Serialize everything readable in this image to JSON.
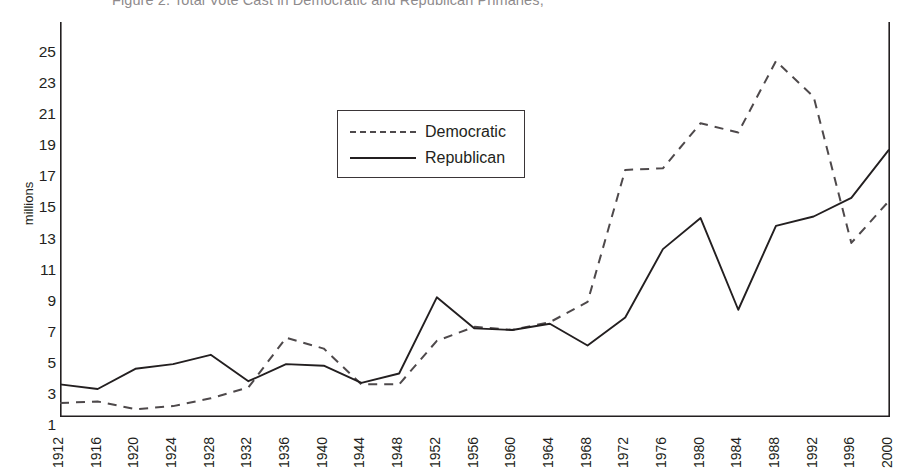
{
  "figure": {
    "title": "Figure 2. Total Vote Cast in Democratic and Republican Primaries,"
  },
  "axes": {
    "ylabel": "millions",
    "xlabel": ""
  },
  "legend": {
    "position": "inside-upper-left",
    "entries": [
      {
        "label": "Democratic",
        "style": "dashed",
        "color": "#4e494b"
      },
      {
        "label": "Republican",
        "style": "solid",
        "color": "#231f20"
      }
    ]
  },
  "chart_data": {
    "type": "line",
    "title": "Figure 2. Total Vote Cast in Democratic and Republican Primaries,",
    "xlabel": "",
    "ylabel": "millions",
    "grid": false,
    "legend_position": "inside-upper-left",
    "xlim": [
      1912,
      2000
    ],
    "ylim": [
      0,
      26
    ],
    "ytick_labels": [
      "25",
      "23",
      "21",
      "19",
      "17",
      "15",
      "13",
      "11",
      "9",
      "7",
      "5",
      "3",
      "1"
    ],
    "ytick_values": [
      25,
      23,
      21,
      19,
      17,
      15,
      13,
      11,
      9,
      7,
      5,
      3,
      1
    ],
    "yminor_step": 1,
    "categories": [
      1912,
      1916,
      1920,
      1924,
      1928,
      1932,
      1936,
      1940,
      1944,
      1948,
      1952,
      1956,
      1960,
      1964,
      1968,
      1972,
      1976,
      1980,
      1984,
      1988,
      1992,
      1996,
      2000
    ],
    "xtick_labels": [
      "1912",
      "1916",
      "1920",
      "1924",
      "1928",
      "1932",
      "1936",
      "1940",
      "1944",
      "1948",
      "1952",
      "1956",
      "1960",
      "1964",
      "1968",
      "1972",
      "1976",
      "1980",
      "1984",
      "1988",
      "1992",
      "1996",
      "2000"
    ],
    "series": [
      {
        "name": "Democratic",
        "style": "dashed",
        "color": "#4e494b",
        "values": [
          1.0,
          1.1,
          0.6,
          0.8,
          1.3,
          2.0,
          5.2,
          4.5,
          2.2,
          2.2,
          5.0,
          5.9,
          5.7,
          6.2,
          7.5,
          16.0,
          16.1,
          19.0,
          18.4,
          23.0,
          20.7,
          11.3,
          14.0
        ]
      },
      {
        "name": "Republican",
        "style": "solid",
        "color": "#231f20",
        "values": [
          2.2,
          1.9,
          3.2,
          3.5,
          4.1,
          2.4,
          3.5,
          3.4,
          2.3,
          2.9,
          7.8,
          5.8,
          5.7,
          6.1,
          4.7,
          6.5,
          10.9,
          12.9,
          7.0,
          12.4,
          13.0,
          14.2,
          17.3
        ]
      }
    ]
  }
}
